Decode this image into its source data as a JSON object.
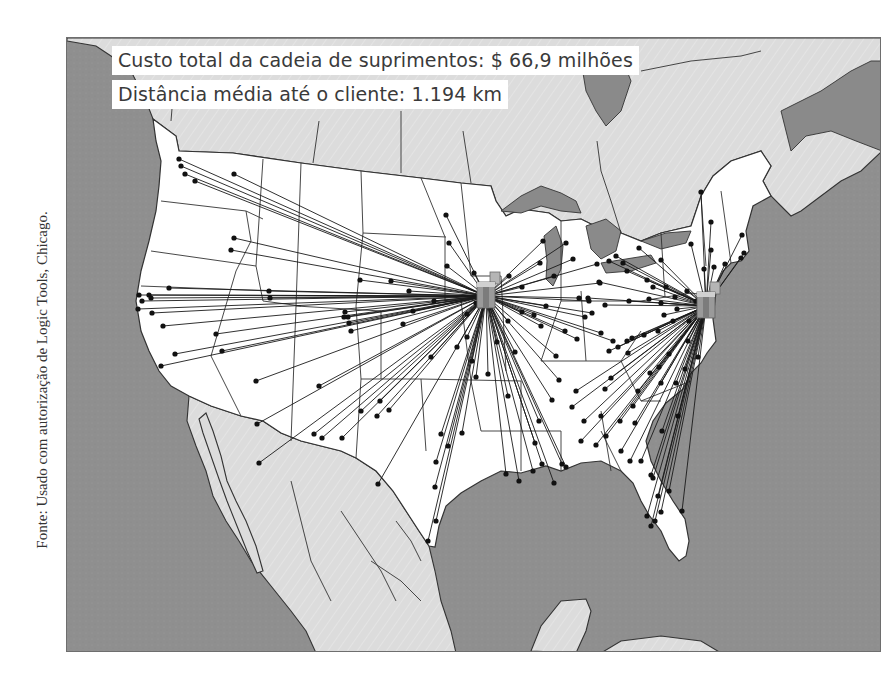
{
  "stats": {
    "cost_label": "Custo total da cadeia de suprimentos: $ 66,9 milhões",
    "distance_label": "Distância média até o cliente: 1.194 km"
  },
  "source_credit": "Fonte: Usado com autorização de Logic Tools, Chicago.",
  "colors": {
    "ocean": "#8f8f8f",
    "foreign_land": "#dcdcdc",
    "us_land": "#ffffff",
    "lakes": "#8a8a8a",
    "borders": "#333333",
    "routes": "#1a1a1a",
    "customer_dot": "#111111",
    "warehouse": "#9a9a9a",
    "text": "#3a3a3a"
  },
  "warehouses": [
    {
      "name": "warehouse-chicago-region",
      "x": 485,
      "y": 295
    },
    {
      "name": "warehouse-east-coast-region",
      "x": 705,
      "y": 305
    }
  ],
  "customers_hub1": [
    [
      178,
      158
    ],
    [
      180,
      165
    ],
    [
      184,
      173
    ],
    [
      194,
      180
    ],
    [
      233,
      173
    ],
    [
      233,
      237
    ],
    [
      230,
      249
    ],
    [
      138,
      294
    ],
    [
      148,
      294
    ],
    [
      168,
      287
    ],
    [
      150,
      297
    ],
    [
      268,
      290
    ],
    [
      269,
      297
    ],
    [
      141,
      300
    ],
    [
      137,
      308
    ],
    [
      151,
      312
    ],
    [
      162,
      325
    ],
    [
      174,
      353
    ],
    [
      160,
      365
    ],
    [
      215,
      333
    ],
    [
      221,
      350
    ],
    [
      255,
      380
    ],
    [
      256,
      423
    ],
    [
      313,
      433
    ],
    [
      318,
      385
    ],
    [
      258,
      462
    ],
    [
      321,
      437
    ],
    [
      341,
      437
    ],
    [
      347,
      316
    ],
    [
      348,
      322
    ],
    [
      350,
      330
    ],
    [
      379,
      400
    ],
    [
      376,
      415
    ],
    [
      377,
      483
    ],
    [
      435,
      461
    ],
    [
      434,
      486
    ],
    [
      427,
      540
    ],
    [
      435,
      520
    ],
    [
      447,
      445
    ],
    [
      440,
      433
    ],
    [
      461,
      432
    ],
    [
      471,
      360
    ],
    [
      475,
      376
    ],
    [
      496,
      341
    ],
    [
      507,
      395
    ],
    [
      551,
      399
    ],
    [
      505,
      473
    ],
    [
      518,
      480
    ],
    [
      532,
      470
    ],
    [
      541,
      463
    ],
    [
      561,
      463
    ],
    [
      565,
      466
    ],
    [
      534,
      442
    ],
    [
      553,
      482
    ],
    [
      558,
      379
    ],
    [
      538,
      420
    ],
    [
      487,
      373
    ],
    [
      445,
      214
    ],
    [
      448,
      242
    ],
    [
      446,
      265
    ],
    [
      473,
      272
    ],
    [
      508,
      275
    ],
    [
      521,
      286
    ],
    [
      539,
      262
    ],
    [
      553,
      275
    ],
    [
      599,
      282
    ],
    [
      596,
      263
    ],
    [
      578,
      297
    ],
    [
      588,
      300
    ],
    [
      584,
      316
    ],
    [
      591,
      312
    ],
    [
      576,
      338
    ],
    [
      564,
      330
    ],
    [
      514,
      351
    ],
    [
      540,
      325
    ],
    [
      555,
      355
    ],
    [
      507,
      320
    ],
    [
      533,
      314
    ],
    [
      545,
      305
    ],
    [
      521,
      311
    ],
    [
      475,
      302
    ],
    [
      466,
      313
    ],
    [
      433,
      300
    ],
    [
      408,
      290
    ],
    [
      412,
      310
    ],
    [
      402,
      323
    ],
    [
      390,
      280
    ],
    [
      359,
      279
    ],
    [
      344,
      311
    ],
    [
      343,
      316
    ],
    [
      360,
      410
    ],
    [
      388,
      409
    ],
    [
      430,
      356
    ],
    [
      456,
      346
    ],
    [
      466,
      336
    ],
    [
      542,
      240
    ],
    [
      565,
      242
    ],
    [
      572,
      258
    ],
    [
      612,
      340
    ],
    [
      600,
      332
    ]
  ],
  "customers_hub2": [
    [
      700,
      191
    ],
    [
      710,
      221
    ],
    [
      710,
      249
    ],
    [
      741,
      234
    ],
    [
      743,
      252
    ],
    [
      740,
      257
    ],
    [
      724,
      263
    ],
    [
      713,
      266
    ],
    [
      703,
      268
    ],
    [
      690,
      243
    ],
    [
      660,
      259
    ],
    [
      638,
      247
    ],
    [
      622,
      262
    ],
    [
      615,
      255
    ],
    [
      608,
      260
    ],
    [
      626,
      270
    ],
    [
      646,
      279
    ],
    [
      652,
      286
    ],
    [
      665,
      286
    ],
    [
      674,
      296
    ],
    [
      686,
      290
    ],
    [
      695,
      300
    ],
    [
      604,
      304
    ],
    [
      587,
      297
    ],
    [
      598,
      281
    ],
    [
      628,
      300
    ],
    [
      648,
      298
    ],
    [
      660,
      302
    ],
    [
      663,
      314
    ],
    [
      676,
      308
    ],
    [
      688,
      320
    ],
    [
      672,
      320
    ],
    [
      657,
      330
    ],
    [
      643,
      334
    ],
    [
      631,
      337
    ],
    [
      626,
      340
    ],
    [
      617,
      346
    ],
    [
      608,
      350
    ],
    [
      627,
      352
    ],
    [
      610,
      377
    ],
    [
      604,
      388
    ],
    [
      637,
      390
    ],
    [
      649,
      372
    ],
    [
      658,
      366
    ],
    [
      668,
      353
    ],
    [
      687,
      340
    ],
    [
      697,
      356
    ],
    [
      684,
      368
    ],
    [
      675,
      382
    ],
    [
      660,
      382
    ],
    [
      632,
      405
    ],
    [
      619,
      420
    ],
    [
      605,
      435
    ],
    [
      595,
      444
    ],
    [
      583,
      420
    ],
    [
      571,
      406
    ],
    [
      575,
      390
    ],
    [
      600,
      415
    ],
    [
      620,
      450
    ],
    [
      629,
      460
    ],
    [
      640,
      460
    ],
    [
      650,
      474
    ],
    [
      652,
      477
    ],
    [
      657,
      495
    ],
    [
      660,
      511
    ],
    [
      646,
      515
    ],
    [
      654,
      520
    ],
    [
      650,
      525
    ],
    [
      681,
      510
    ],
    [
      668,
      490
    ],
    [
      634,
      422
    ],
    [
      661,
      430
    ],
    [
      677,
      415
    ],
    [
      580,
      440
    ]
  ],
  "map": {
    "us_outline": "M152,118 L175,135 L178,150 L232,152 L300,162 L360,170 L420,177 L460,182 L490,185 L495,200 L505,215 L520,208 L548,212 L560,220 L580,218 L600,228 L620,232 L640,240 L660,232 L690,225 L700,195 L712,175 L730,160 L760,150 L770,165 L762,180 L770,195 L752,205 L745,230 L748,250 L740,260 L730,262 L722,270 L716,282 L714,300 L712,318 L715,340 L706,352 L700,362 L690,372 L682,388 L665,402 L652,420 L645,440 L650,460 L660,480 L672,500 L684,518 L688,540 L685,555 L678,560 L668,548 L660,530 L648,514 L640,500 L632,482 L620,470 L600,460 L580,462 L560,470 L545,465 L520,472 L500,470 L480,480 L460,492 L445,505 L438,525 L434,546 L428,545 L418,530 L405,510 L392,490 L375,470 L355,457 L340,450 L320,445 L300,440 L280,432 L262,420 L240,415 L210,405 L188,395 L170,385 L158,370 L148,350 L140,330 L135,300 L140,270 L148,240 L155,210 L158,185 L160,160 L155,140 Z",
    "canada_outline": "M66,37 L881,37 L881,150 L860,170 L840,180 L820,195 L800,210 L790,215 L780,205 L770,195 L762,180 L770,165 L760,150 L730,160 L712,175 L700,195 L690,225 L660,232 L640,240 L620,232 L600,228 L580,218 L560,220 L548,212 L520,208 L505,215 L495,200 L490,185 L460,182 L420,177 L360,170 L300,162 L232,152 L178,150 L175,135 L152,118 L145,100 L130,70 L110,55 L95,45 L66,40 Z",
    "mexico_outline": "M188,395 L210,405 L240,415 L262,420 L280,432 L300,440 L320,445 L340,450 L355,457 L375,470 L392,490 L405,510 L418,530 L428,545 L434,570 L440,600 L450,630 L455,652 L315,652 L305,630 L290,610 L270,585 L250,560 L238,540 L225,520 L212,495 L205,470 L195,445 L186,420 Z",
    "baja_outline": "M205,412 L212,430 L220,455 L226,480 L235,500 L245,520 L255,545 L262,570 L256,572 L246,550 L236,525 L226,500 L218,478 L210,455 L202,432 L198,418 Z",
    "yucatan_outline": "M530,650 L540,625 L560,600 L585,598 L590,610 L585,630 L575,652 Z",
    "cuba_outline": "M600,652 L620,640 L660,635 L700,640 L720,652 Z",
    "lakes": [
      "M500,210 L520,195 L540,185 L560,192 L575,200 L580,212 L560,210 L540,205 L520,212 Z",
      "M543,235 L555,225 L562,245 L560,268 L552,285 L545,278 L546,260 Z",
      "M585,225 L605,218 L620,230 L615,250 L600,258 L590,248 Z",
      "M600,262 L625,258 L650,254 L655,262 L630,270 L605,272 Z",
      "M640,240 L665,232 L690,230 L685,242 L660,248 Z",
      "M580,60 L620,55 L630,80 L620,110 L605,125 L595,110 L585,90 Z",
      "M780,110 L820,90 L850,70 L870,60 L881,60 L881,150 L855,140 L830,130 L805,135 L790,150 Z"
    ],
    "us_internal_borders": [
      "M160,200 L245,210 L262,218",
      "M245,210 L250,240 L235,270",
      "M262,158 L255,265",
      "M150,250 L255,265",
      "M140,285 L270,290",
      "M255,265 L262,300 L300,305",
      "M235,270 L210,355 L240,415",
      "M300,162 L295,305 L290,440",
      "M295,305 L380,310",
      "M360,170 L362,232 L355,305",
      "M362,232 L445,236",
      "M420,177 L444,236 L444,300",
      "M355,305 L360,378 L420,378",
      "M380,310 L380,378",
      "M420,378 L425,450",
      "M360,378 L355,457",
      "M444,300 L460,300 L470,380",
      "M420,378 L520,380",
      "M460,182 L470,275 L500,275",
      "M470,380 L480,430 L560,430",
      "M520,380 L520,470",
      "M500,275 L505,370",
      "M560,220 L560,300 L540,360",
      "M560,300 L640,300",
      "M580,290 L585,360",
      "M540,360 L620,360 L640,330",
      "M620,360 L640,400 L660,400",
      "M560,430 L560,470",
      "M600,430 L620,470",
      "M600,410 L610,470",
      "M640,400 L690,380",
      "M640,300 L690,292 L712,295",
      "M660,232 L664,296",
      "M700,195 L705,265",
      "M720,190 L730,262"
    ],
    "foreign_borders": [
      "M170,120 L172,95",
      "M312,162 L318,120",
      "M400,172 L400,110",
      "M470,182 L462,130",
      "M620,232 L610,200 L600,170 L596,140",
      "M640,70 L690,60 L740,55 L760,50",
      "M290,480 L300,520 L310,560 L330,600",
      "M340,510 L360,540 L380,570 L395,600",
      "M370,560 L400,580 L420,600",
      "M395,520 L410,540 L420,560"
    ]
  }
}
